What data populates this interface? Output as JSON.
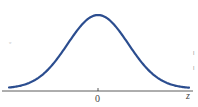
{
  "chart_data": {
    "type": "line",
    "title": "",
    "xlabel": "z",
    "ylabel": "",
    "x_ticks": [
      "0"
    ],
    "series": [
      {
        "name": "Standard normal density",
        "color": "#2b4d8f",
        "x": [
          -3.0,
          -2.5,
          -2.0,
          -1.5,
          -1.0,
          -0.5,
          0.0,
          0.5,
          1.0,
          1.5,
          2.0,
          2.5,
          3.0
        ],
        "y": [
          0.0044,
          0.0175,
          0.054,
          0.1295,
          0.242,
          0.3521,
          0.3989,
          0.3521,
          0.242,
          0.1295,
          0.054,
          0.0175,
          0.0044
        ]
      }
    ],
    "xlim": [
      -3.2,
      3.2
    ],
    "ylim": [
      0,
      0.4
    ],
    "grid": false,
    "legend": null
  },
  "labels": {
    "x_axis_label": "z",
    "x_tick_zero": "0",
    "left_margin_mark": "ᵩ",
    "right_margin_mark_1": "ǀ",
    "right_margin_mark_2": "ǀ"
  }
}
